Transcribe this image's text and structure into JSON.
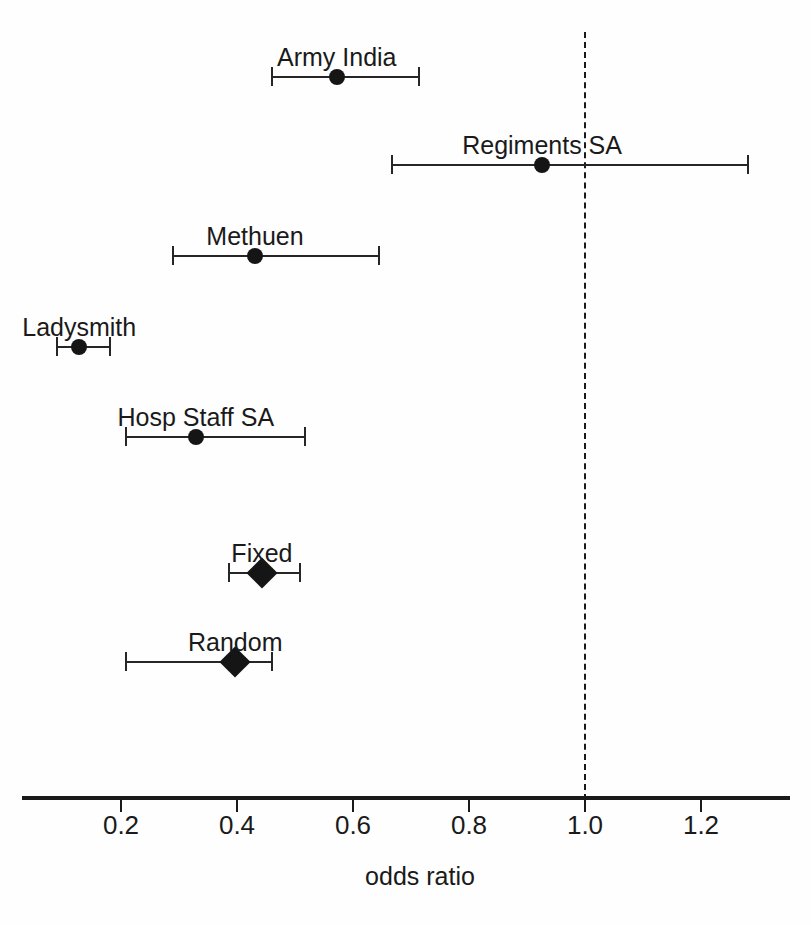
{
  "chart_data": {
    "type": "forest",
    "title": "",
    "xlabel": "odds ratio",
    "ylabel": "",
    "xlim": [
      0.0,
      1.39
    ],
    "xticks": [
      0.2,
      0.4,
      0.6,
      0.8,
      1.0,
      1.2
    ],
    "xtick_labels": [
      "0.2",
      "0.4",
      "0.6",
      "0.8",
      "1.0",
      "1.2"
    ],
    "grid": false,
    "legend": "none",
    "reference_line": 1.0,
    "reference_line_style": "dashed",
    "marker_color": "#151515",
    "line_color": "#262626",
    "axis_color": "#1a1a1a",
    "rows": [
      {
        "label": "Army India",
        "estimate": 0.572,
        "ci_low": 0.46,
        "ci_high": 0.714,
        "marker": "square",
        "kind": "study"
      },
      {
        "label": "Regiments SA",
        "estimate": 0.926,
        "ci_low": 0.667,
        "ci_high": 1.281,
        "marker": "square",
        "kind": "study"
      },
      {
        "label": "Methuen",
        "estimate": 0.431,
        "ci_low": 0.29,
        "ci_high": 0.645,
        "marker": "square",
        "kind": "study"
      },
      {
        "label": "Ladysmith",
        "estimate": 0.128,
        "ci_low": 0.09,
        "ci_high": 0.181,
        "marker": "square",
        "kind": "study"
      },
      {
        "label": "Hosp Staff SA",
        "estimate": 0.329,
        "ci_low": 0.209,
        "ci_high": 0.517,
        "marker": "square",
        "kind": "study"
      },
      {
        "label": "Fixed",
        "estimate": 0.443,
        "ci_low": 0.386,
        "ci_high": 0.509,
        "marker": "diamond",
        "kind": "summary"
      },
      {
        "label": "Random",
        "estimate": 0.397,
        "ci_low": 0.209,
        "ci_high": 0.46,
        "marker": "diamond",
        "kind": "summary"
      }
    ]
  },
  "layout": {
    "plot_left_px": 22,
    "plot_right_px": 790,
    "x_origin_px": 5,
    "px_per_unit": 580,
    "axis_y_px": 796,
    "tick_label_y_px": 812,
    "axis_title_y_px": 864,
    "axis_title_x_px": 420,
    "ref_line_top_px": 32,
    "row_y_px": [
      77,
      165,
      256,
      347,
      437,
      573,
      662
    ],
    "label_offset_px": 32
  }
}
